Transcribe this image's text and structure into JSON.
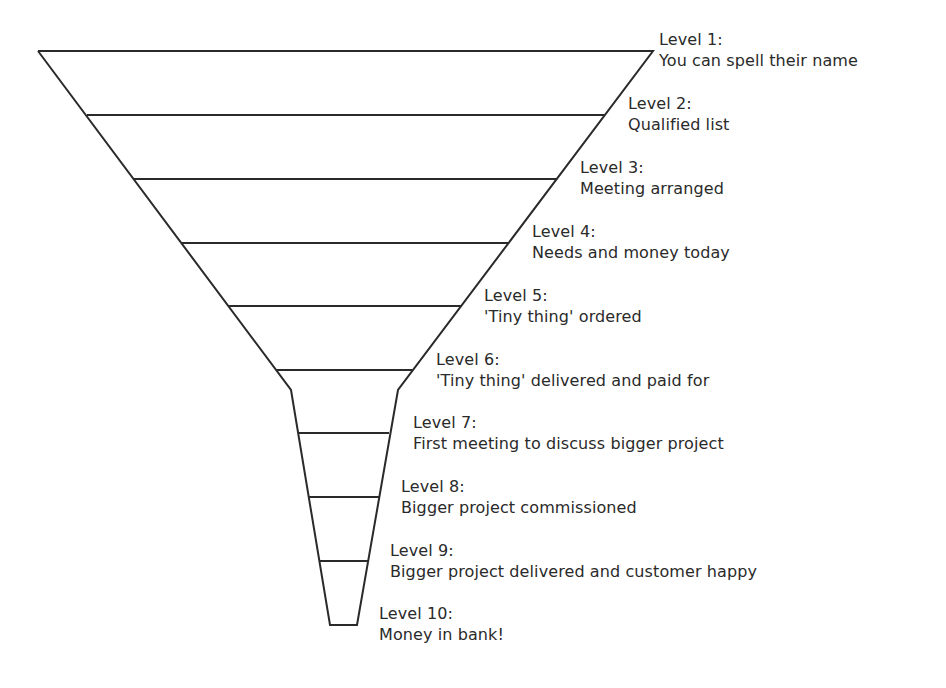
{
  "diagram": {
    "type": "funnel",
    "stroke_color": "#2a2a2a",
    "background": "#ffffff",
    "levels": [
      {
        "title": "Level 1:",
        "description": "You can spell their name",
        "label_x": 659,
        "label_y": 29
      },
      {
        "title": "Level 2:",
        "description": "Qualified list",
        "label_x": 628,
        "label_y": 93
      },
      {
        "title": "Level 3:",
        "description": "Meeting arranged",
        "label_x": 580,
        "label_y": 157
      },
      {
        "title": "Level 4:",
        "description": "Needs and money today",
        "label_x": 532,
        "label_y": 221
      },
      {
        "title": "Level 5:",
        "description": "'Tiny thing' ordered",
        "label_x": 484,
        "label_y": 285
      },
      {
        "title": "Level 6:",
        "description": "'Tiny thing' delivered and paid for",
        "label_x": 436,
        "label_y": 349
      },
      {
        "title": "Level 7:",
        "description": "First meeting to discuss bigger project",
        "label_x": 413,
        "label_y": 412
      },
      {
        "title": "Level 8:",
        "description": "Bigger project commissioned",
        "label_x": 401,
        "label_y": 476
      },
      {
        "title": "Level 9:",
        "description": "Bigger project delivered and customer happy",
        "label_x": 390,
        "label_y": 540
      },
      {
        "title": "Level 10:",
        "description": "Money in bank!",
        "label_x": 379,
        "label_y": 603
      }
    ]
  }
}
